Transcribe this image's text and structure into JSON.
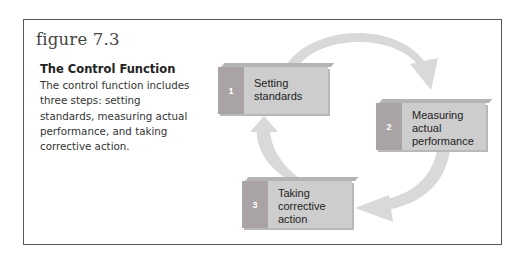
{
  "figure": {
    "number": "figure 7.3",
    "title": "The Control Function",
    "caption": "The control function includes three steps: setting standards, measuring actual performance, and taking corrective action."
  },
  "diagram": {
    "type": "cycle",
    "steps": [
      {
        "number": "1",
        "label": "Setting standards"
      },
      {
        "number": "2",
        "label": "Measuring actual performance"
      },
      {
        "number": "3",
        "label": "Taking corrective action"
      }
    ],
    "flow": [
      "1 → 2",
      "2 → 3",
      "3 → 1"
    ]
  },
  "colors": {
    "arrow": "#d9d9d9",
    "number_strip": "#a9a3a5",
    "label_fill": "#cdcdcd",
    "frame": "#555555"
  }
}
